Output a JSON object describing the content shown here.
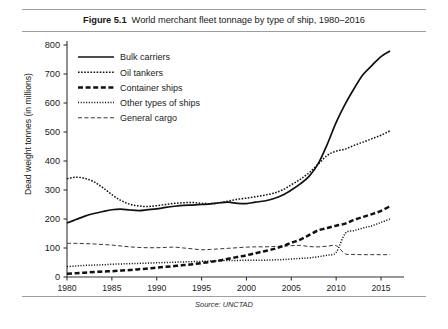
{
  "figure": {
    "number_label": "Figure 5.1",
    "title": "World merchant fleet tonnage by type of ship, 1980–2016",
    "source": "Source: UNCTAD"
  },
  "chart_data": {
    "type": "line",
    "xlabel": "",
    "ylabel": "Dead weight tonnes (in millions)",
    "xlim": [
      1980,
      2016
    ],
    "ylim": [
      0,
      800
    ],
    "yticks": [
      0,
      100,
      200,
      300,
      400,
      500,
      600,
      700,
      800
    ],
    "ytick_labels": [
      "0",
      "100",
      "200",
      "300",
      "400",
      "500",
      "600",
      "700",
      "800"
    ],
    "xticks": [
      1980,
      1985,
      1990,
      1995,
      2000,
      2005,
      2010,
      2015
    ],
    "xtick_labels": [
      "1980",
      "1985",
      "1990",
      "1995",
      "2000",
      "2005",
      "2010",
      "2015"
    ],
    "grid": false,
    "legend_position": "upper left",
    "source_note": "Source: UNCTAD",
    "x": [
      1980,
      1981,
      1982,
      1983,
      1984,
      1985,
      1986,
      1987,
      1988,
      1989,
      1990,
      1991,
      1992,
      1993,
      1994,
      1995,
      1996,
      1997,
      1998,
      1999,
      2000,
      2001,
      2002,
      2003,
      2004,
      2005,
      2006,
      2007,
      2008,
      2009,
      2010,
      2011,
      2012,
      2013,
      2014,
      2015,
      2016
    ],
    "series": [
      {
        "name": "Bulk carriers",
        "line_style": "solid",
        "color": "#111111",
        "values": [
          186,
          198,
          210,
          219,
          226,
          232,
          234,
          231,
          229,
          232,
          235,
          240,
          244,
          247,
          248,
          250,
          252,
          256,
          258,
          254,
          253,
          258,
          262,
          270,
          282,
          300,
          321,
          348,
          391,
          457,
          533,
          596,
          650,
          698,
          730,
          760,
          779
        ]
      },
      {
        "name": "Oil tankers",
        "line_style": "dotted-coarse",
        "color": "#111111",
        "values": [
          339,
          344,
          340,
          328,
          308,
          284,
          264,
          251,
          245,
          243,
          246,
          250,
          254,
          256,
          257,
          254,
          253,
          256,
          262,
          268,
          272,
          277,
          282,
          289,
          300,
          318,
          337,
          360,
          389,
          419,
          434,
          441,
          454,
          465,
          477,
          489,
          504
        ]
      },
      {
        "name": "Container ships",
        "line_style": "dashed-heavy",
        "color": "#111111",
        "values": [
          11,
          13,
          15,
          17,
          19,
          20,
          22,
          24,
          27,
          29,
          32,
          35,
          38,
          41,
          44,
          48,
          52,
          57,
          63,
          69,
          75,
          82,
          89,
          96,
          106,
          118,
          129,
          145,
          161,
          169,
          177,
          184,
          197,
          207,
          217,
          228,
          244
        ]
      },
      {
        "name": "Other types of ships",
        "line_style": "dotted-fine",
        "color": "#111111",
        "values": [
          36,
          38,
          40,
          41,
          42,
          44,
          45,
          46,
          47,
          48,
          49,
          50,
          51,
          52,
          53,
          54,
          55,
          56,
          57,
          57,
          58,
          58,
          58,
          59,
          60,
          62,
          64,
          66,
          70,
          75,
          85,
          150,
          160,
          169,
          177,
          188,
          200
        ]
      },
      {
        "name": "General cargo",
        "line_style": "dashed-fine",
        "color": "#111111",
        "values": [
          116,
          116,
          115,
          114,
          112,
          110,
          107,
          104,
          102,
          101,
          101,
          102,
          103,
          100,
          97,
          94,
          95,
          97,
          99,
          101,
          103,
          104,
          104,
          105,
          106,
          108,
          109,
          105,
          104,
          106,
          108,
          80,
          78,
          77,
          77,
          77,
          77
        ]
      }
    ]
  },
  "legend": {
    "items": [
      {
        "label": "Bulk carriers",
        "style": "solid"
      },
      {
        "label": "Oil tankers",
        "style": "dotted-coarse"
      },
      {
        "label": "Container ships",
        "style": "dashed-heavy"
      },
      {
        "label": "Other types of ships",
        "style": "dotted-fine"
      },
      {
        "label": "General cargo",
        "style": "dashed-fine"
      }
    ]
  }
}
